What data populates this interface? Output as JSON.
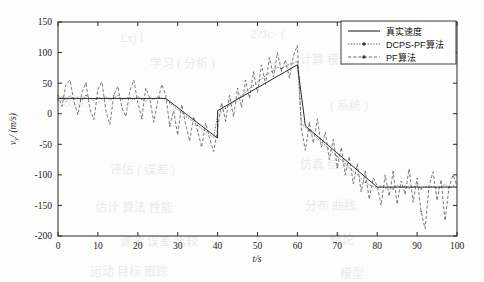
{
  "figure": {
    "background_color": "#fdfdfb",
    "axis_color": "#2a2a2a"
  },
  "bleed_text": [
    {
      "text": "£xj l",
      "x": 120,
      "y": 30,
      "size": 13
    },
    {
      "text": "2?Jc· (",
      "x": 250,
      "y": 26,
      "size": 13
    },
    {
      "text": "· 1 ·",
      "x": 395,
      "y": 34,
      "size": 13
    },
    {
      "text": "学习 ( 分析 )",
      "x": 150,
      "y": 54,
      "size": 12
    },
    {
      "text": "计算 模型",
      "x": 300,
      "y": 50,
      "size": 12
    },
    {
      "text": "数据",
      "x": 60,
      "y": 92,
      "size": 12
    },
    {
      "text": "( 系统 )",
      "x": 330,
      "y": 96,
      "size": 12
    },
    {
      "text": "评估 ( 误差 )",
      "x": 110,
      "y": 160,
      "size": 12
    },
    {
      "text": "仿真 结果",
      "x": 300,
      "y": 155,
      "size": 12
    },
    {
      "text": "估计 算法 性能",
      "x": 95,
      "y": 198,
      "size": 12
    },
    {
      "text": "分布 曲线",
      "x": 305,
      "y": 196,
      "size": 12
    },
    {
      "text": "滤波 误差 比较",
      "x": 120,
      "y": 232,
      "size": 12
    },
    {
      "text": "结论",
      "x": 330,
      "y": 230,
      "size": 12
    },
    {
      "text": "运动 目标 跟踪",
      "x": 90,
      "y": 262,
      "size": 12
    },
    {
      "text": "模型",
      "x": 340,
      "y": 264,
      "size": 12
    }
  ],
  "chart_data": {
    "type": "line",
    "title": "",
    "xlabel": "t/s",
    "ylabel": "v_y/ (m/s)",
    "xlim": [
      0,
      100
    ],
    "ylim": [
      -200,
      150
    ],
    "xticks": [
      0,
      10,
      20,
      30,
      40,
      50,
      60,
      70,
      80,
      90,
      100
    ],
    "xticklabels": [
      "0",
      "10",
      "20",
      "30",
      "40",
      "50",
      "60",
      "70",
      "80",
      "90",
      "100"
    ],
    "yticks": [
      -200,
      -150,
      -100,
      -50,
      0,
      50,
      100,
      150
    ],
    "yticklabels": [
      "-200",
      "-150",
      "-100",
      "-50",
      "0",
      "50",
      "100",
      "150"
    ],
    "grid": false,
    "legend_position": "upper right",
    "legend_entries": [
      "真实速度",
      "DCPS-PF算法",
      "PF算法"
    ],
    "series": [
      {
        "name": "真实速度",
        "style": "solid",
        "x": [
          0,
          27,
          40,
          40,
          60,
          60,
          62,
          80,
          100
        ],
        "values": [
          25,
          25,
          -40,
          5,
          80,
          80,
          -20,
          -120,
          -120
        ]
      },
      {
        "name": "DCPS-PF算法",
        "style": "dotted-marker",
        "x": [
          0,
          1,
          2,
          3,
          4,
          5,
          6,
          7,
          8,
          9,
          10,
          11,
          12,
          13,
          14,
          15,
          16,
          17,
          18,
          19,
          20,
          21,
          22,
          23,
          24,
          25,
          26,
          27,
          28,
          29,
          30,
          31,
          32,
          33,
          34,
          35,
          36,
          37,
          38,
          39,
          40,
          41,
          42,
          43,
          44,
          45,
          46,
          47,
          48,
          49,
          50,
          51,
          52,
          53,
          54,
          55,
          56,
          57,
          58,
          59,
          60,
          61,
          62,
          63,
          64,
          65,
          66,
          67,
          68,
          69,
          70,
          71,
          72,
          73,
          74,
          75,
          76,
          77,
          78,
          79,
          80,
          81,
          82,
          83,
          84,
          85,
          86,
          87,
          88,
          89,
          90,
          91,
          92,
          93,
          94,
          95,
          96,
          97,
          98,
          99,
          100
        ],
        "values": [
          22,
          28,
          20,
          30,
          24,
          26,
          22,
          30,
          25,
          21,
          27,
          24,
          28,
          22,
          26,
          30,
          23,
          25,
          27,
          22,
          28,
          24,
          20,
          26,
          23,
          28,
          25,
          24,
          18,
          12,
          7,
          2,
          -4,
          -9,
          -13,
          -19,
          -24,
          -29,
          -34,
          -39,
          -3,
          3,
          9,
          14,
          19,
          25,
          30,
          35,
          41,
          46,
          52,
          57,
          62,
          67,
          71,
          76,
          74,
          78,
          81,
          83,
          86,
          -16,
          -22,
          -28,
          -34,
          -40,
          -46,
          -52,
          -58,
          -64,
          -70,
          -76,
          -82,
          -88,
          -94,
          -100,
          -106,
          -112,
          -116,
          -119,
          -121,
          -118,
          -122,
          -119,
          -123,
          -117,
          -121,
          -118,
          -122,
          -120,
          -117,
          -123,
          -119,
          -121,
          -118,
          -122,
          -120,
          -116,
          -121,
          -118,
          -120
        ]
      },
      {
        "name": "PF算法",
        "style": "dashed-marker",
        "x": [
          0,
          1,
          2,
          3,
          4,
          5,
          6,
          7,
          8,
          9,
          10,
          11,
          12,
          13,
          14,
          15,
          16,
          17,
          18,
          19,
          20,
          21,
          22,
          23,
          24,
          25,
          26,
          27,
          28,
          29,
          30,
          31,
          32,
          33,
          34,
          35,
          36,
          37,
          38,
          39,
          40,
          41,
          42,
          43,
          44,
          45,
          46,
          47,
          48,
          49,
          50,
          51,
          52,
          53,
          54,
          55,
          56,
          57,
          58,
          59,
          60,
          61,
          62,
          63,
          64,
          65,
          66,
          67,
          68,
          69,
          70,
          71,
          72,
          73,
          74,
          75,
          76,
          77,
          78,
          79,
          80,
          81,
          82,
          83,
          84,
          85,
          86,
          87,
          88,
          89,
          90,
          91,
          92,
          93,
          94,
          95,
          96,
          97,
          98,
          99,
          100
        ],
        "values": [
          30,
          12,
          48,
          55,
          20,
          -2,
          35,
          50,
          8,
          -10,
          40,
          52,
          5,
          -18,
          30,
          45,
          10,
          -5,
          38,
          55,
          18,
          -8,
          42,
          25,
          -14,
          20,
          48,
          30,
          -20,
          5,
          -35,
          15,
          -18,
          -45,
          -5,
          -28,
          -55,
          -15,
          -40,
          -62,
          -25,
          18,
          -12,
          30,
          -5,
          42,
          10,
          55,
          25,
          68,
          35,
          80,
          48,
          92,
          60,
          100,
          70,
          88,
          58,
          95,
          112,
          -25,
          -60,
          -15,
          -48,
          -8,
          -55,
          -30,
          -75,
          -42,
          -88,
          -55,
          -100,
          -70,
          -115,
          -82,
          -128,
          -95,
          -140,
          -105,
          -118,
          -150,
          -100,
          -135,
          -95,
          -148,
          -110,
          -132,
          -90,
          -145,
          -105,
          -160,
          -188,
          -118,
          -95,
          -142,
          -108,
          -175,
          -120,
          -100,
          -118
        ]
      }
    ]
  }
}
